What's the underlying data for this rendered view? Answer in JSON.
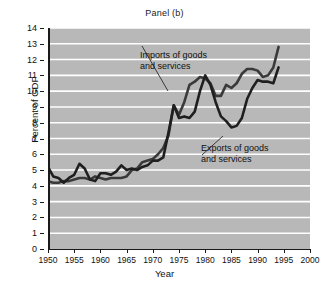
{
  "figure": {
    "title": "Panel (b)",
    "background_color": "#b8b8b8",
    "gridline_color": "#ffffff",
    "axis_color": "#1a1a1a"
  },
  "axes": {
    "x_title": "Year",
    "y_title": "Percent of GDP",
    "x_ticks": [
      "1950",
      "1955",
      "1960",
      "1965",
      "1970",
      "1975",
      "1980",
      "1985",
      "1990",
      "1995",
      "2000"
    ],
    "y_ticks": [
      "0",
      "1",
      "2",
      "3",
      "4",
      "5",
      "6",
      "7",
      "8",
      "9",
      "10",
      "11",
      "12",
      "13",
      "14"
    ]
  },
  "annotations": {
    "imports": {
      "line1": "Imports of goods",
      "line2": "and services"
    },
    "exports": {
      "line1": "Exports of goods",
      "line2": "and services"
    }
  },
  "chart_data": {
    "type": "line",
    "title": "Panel (b)",
    "xlabel": "Year",
    "ylabel": "Percent of GDP",
    "xlim": [
      1950,
      2000
    ],
    "ylim": [
      0,
      14
    ],
    "grid": true,
    "grid_orientation": "horizontal",
    "legend": "annotated-inline",
    "x": [
      1950,
      1951,
      1952,
      1953,
      1954,
      1955,
      1956,
      1957,
      1958,
      1959,
      1960,
      1961,
      1962,
      1963,
      1964,
      1965,
      1966,
      1967,
      1968,
      1969,
      1970,
      1971,
      1972,
      1973,
      1974,
      1975,
      1976,
      1977,
      1978,
      1979,
      1980,
      1981,
      1982,
      1983,
      1984,
      1985,
      1986,
      1987,
      1988,
      1989,
      1990,
      1991,
      1992,
      1993,
      1994
    ],
    "series": [
      {
        "name": "Imports of goods and services",
        "color": "#3a3a3a",
        "line_width": 2.6,
        "values": [
          4.3,
          4.2,
          4.2,
          4.3,
          4.3,
          4.4,
          4.5,
          4.5,
          4.4,
          4.6,
          4.5,
          4.4,
          4.5,
          4.5,
          4.5,
          4.6,
          5.0,
          5.1,
          5.5,
          5.6,
          5.7,
          6.0,
          6.4,
          7.2,
          9.1,
          8.5,
          9.3,
          10.4,
          10.6,
          10.9,
          10.8,
          10.5,
          9.7,
          9.7,
          10.4,
          10.2,
          10.5,
          11.1,
          11.4,
          11.4,
          11.3,
          10.9,
          11.0,
          11.5,
          12.8
        ]
      },
      {
        "name": "Exports of goods and services",
        "color": "#1f1f1f",
        "line_width": 2.6,
        "values": [
          5.2,
          4.6,
          4.5,
          4.2,
          4.5,
          4.7,
          5.4,
          5.1,
          4.4,
          4.3,
          4.8,
          4.8,
          4.7,
          4.9,
          5.3,
          5.0,
          5.1,
          5.0,
          5.2,
          5.3,
          5.6,
          5.6,
          5.8,
          7.4,
          9.1,
          8.3,
          8.4,
          8.3,
          8.7,
          10.0,
          11.0,
          10.4,
          9.3,
          8.4,
          8.1,
          7.7,
          7.8,
          8.3,
          9.5,
          10.2,
          10.7,
          10.6,
          10.6,
          10.5,
          11.5
        ]
      }
    ]
  }
}
